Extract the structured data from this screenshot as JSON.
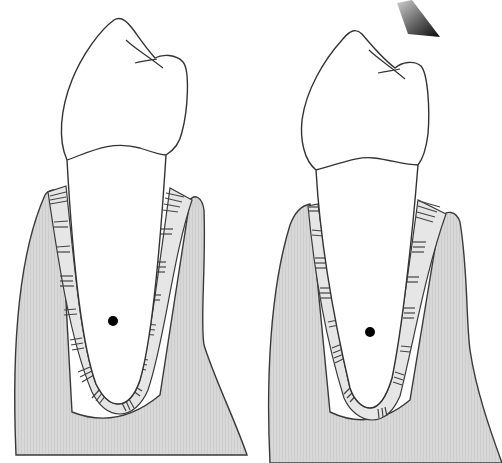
{
  "figure": {
    "type": "dental-diagram",
    "panels": [
      {
        "id": "left",
        "description": "Tooth in alveolar bone, no force applied",
        "parts": [
          "crown",
          "root",
          "periodontal-ligament",
          "alveolar-bone",
          "center-of-rotation-dot"
        ]
      },
      {
        "id": "right",
        "description": "Tooth in alveolar bone with force arrow applied to crown",
        "parts": [
          "crown",
          "root",
          "periodontal-ligament",
          "alveolar-bone",
          "center-of-rotation-dot",
          "force-arrow"
        ]
      }
    ],
    "colors": {
      "background": "#ffffff",
      "bone_fill": "#d6d6d6",
      "outline": "#3a3a3a",
      "tooth_fill": "#ffffff",
      "pdl_fill": "#e4e4e4",
      "dot": "#000000",
      "arrow_dark": "#111111",
      "arrow_light": "#bdbdbd"
    }
  }
}
